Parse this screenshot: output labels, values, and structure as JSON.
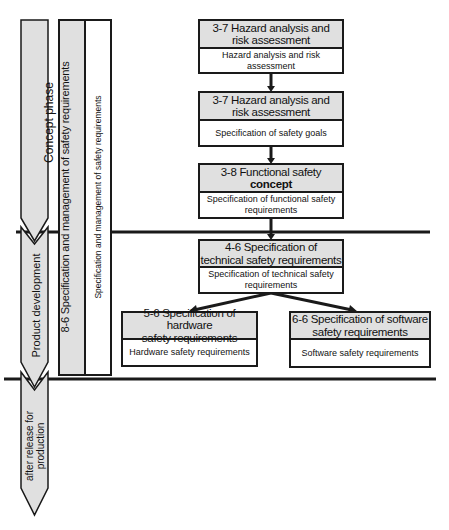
{
  "phases": [
    {
      "label": "Concept phase"
    },
    {
      "label": "Product development"
    },
    {
      "label": "after release for\nproduction"
    }
  ],
  "side_column": {
    "title": "8-6 Specification and management of safety requirements",
    "subtitle": "Specification and management  of safety requirements"
  },
  "boxes": [
    {
      "header": "3-7 Hazard analysis and\nrisk assessment",
      "body": "Hazard analysis and risk\nassessment"
    },
    {
      "header": "3-7 Hazard analysis and\nrisk assessment",
      "body": "Specification of safety goals"
    },
    {
      "header_line1": "3-8 Functional safety",
      "header_line2": "concept",
      "body": "Specification of functional safety\nrequirements"
    },
    {
      "header": "4-6 Specification of\ntechnical safety requirements",
      "body": "Specification of technical safety\nrequirements"
    },
    {
      "header": "5-6 Specification of hardware\nsafety requirements",
      "body": "Hardware  safety requirements"
    },
    {
      "header": "6-6 Specification of software\nsafety requirements",
      "body": "Software  safety requirements"
    }
  ],
  "colors": {
    "fill_gray": "#e0e0e0",
    "line": "#1a1a1a",
    "background": "#ffffff"
  }
}
